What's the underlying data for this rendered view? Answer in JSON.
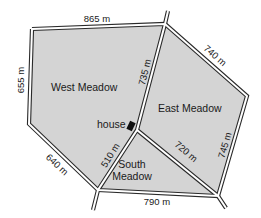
{
  "colors": {
    "meadow_fill": "#d4d4d4",
    "road_edge": "#2a2a2a",
    "road_fill": "#ffffff",
    "house": "#111111",
    "text": "#1a1a1a"
  },
  "meadows": {
    "west": {
      "name": "West Meadow"
    },
    "east": {
      "name": "East Meadow"
    },
    "south": {
      "name_line1": "South",
      "name_line2": "Meadow"
    }
  },
  "house": {
    "label": "house"
  },
  "distances": {
    "top": "865 m",
    "left_upper": "655 m",
    "left_lower": "640 m",
    "center_upper": "735 m",
    "center_lower": "510 m",
    "top_right": "740 m",
    "right": "745 m",
    "center_right": "720 m",
    "bottom": "790 m"
  }
}
